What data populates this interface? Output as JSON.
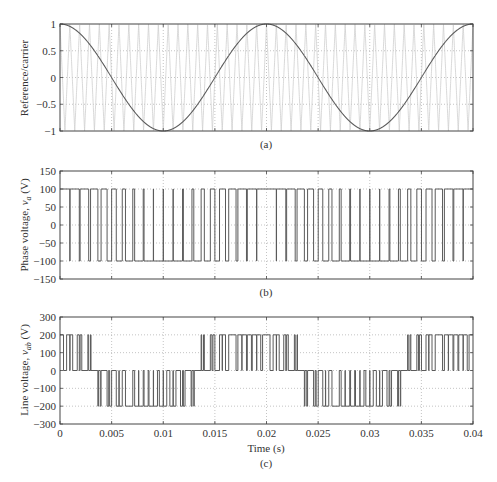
{
  "chart_data": [
    {
      "type": "line",
      "panel": "(a)",
      "title": "",
      "xlabel": "",
      "ylabel": "Reference/carrier",
      "xlim": [
        0,
        0.04
      ],
      "ylim": [
        -1,
        1
      ],
      "yticks": [
        1,
        0.5,
        0,
        -0.5,
        -1
      ],
      "ytick_labels": [
        "1",
        "0.5",
        "0",
        "−0.5",
        "−1"
      ],
      "xticks": [
        0,
        0.005,
        0.01,
        0.015,
        0.02,
        0.025,
        0.03,
        0.035,
        0.04
      ],
      "grid": true,
      "series": [
        {
          "name": "reference",
          "function": "cos(2*pi*50*t)",
          "frequency_hz": 50,
          "amplitude": 1,
          "color": "#555555"
        },
        {
          "name": "carrier",
          "function": "triangle",
          "frequency_hz": 1050,
          "amplitude": 1,
          "color": "#c8c8c8"
        }
      ]
    },
    {
      "type": "line",
      "panel": "(b)",
      "xlabel": "",
      "ylabel": "Phase voltage, v_a (V)",
      "xlim": [
        0,
        0.04
      ],
      "ylim": [
        -150,
        150
      ],
      "yticks": [
        150,
        100,
        50,
        0,
        -50,
        -100,
        -150
      ],
      "ytick_labels": [
        "150",
        "100",
        "50",
        "0",
        "−50",
        "−100",
        "−150"
      ],
      "levels": [
        100,
        -100
      ],
      "grid": true,
      "series": [
        {
          "name": "v_a",
          "description": "bipolar SPWM, +100 V when reference > carrier, else -100 V",
          "color": "#555555"
        }
      ]
    },
    {
      "type": "line",
      "panel": "(c)",
      "xlabel": "Time (s)",
      "ylabel": "Line voltage, v_ab (V)",
      "xlim": [
        0,
        0.04
      ],
      "ylim": [
        -300,
        300
      ],
      "yticks": [
        300,
        200,
        100,
        0,
        -100,
        -200,
        -300
      ],
      "ytick_labels": [
        "300",
        "200",
        "100",
        "0",
        "−100",
        "−200",
        "−300"
      ],
      "xticks": [
        0,
        0.005,
        0.01,
        0.015,
        0.02,
        0.025,
        0.03,
        0.035,
        0.04
      ],
      "xtick_labels": [
        "0",
        "0.005",
        "0.01",
        "0.015",
        "0.02",
        "0.025",
        "0.03",
        "0.035",
        "0.04"
      ],
      "levels": [
        200,
        0,
        -200
      ],
      "grid": true,
      "series": [
        {
          "name": "v_ab",
          "description": "v_a - v_b (v_b phase shifted -120 deg)",
          "color": "#555555"
        }
      ]
    }
  ],
  "captions": {
    "a": "(a)",
    "b": "(b)",
    "c": "(c)"
  },
  "labels": {
    "a_ylabel": "Reference/carrier",
    "b_ylabel_pre": "Phase voltage, ",
    "b_ylabel_var": "v",
    "b_ylabel_sub": "a",
    "b_ylabel_post": " (V)",
    "c_ylabel_pre": "Line voltage, ",
    "c_ylabel_var": "v",
    "c_ylabel_sub": "ab",
    "c_ylabel_post": " (V)",
    "xlabel": "Time (s)"
  },
  "params": {
    "f_ref": 50,
    "f_carrier": 1050,
    "vdc_half": 100
  },
  "colors": {
    "axis": "#444444",
    "grid": "#aaaaaa",
    "trace": "#5a5a5a",
    "carrier": "#cccccc"
  }
}
